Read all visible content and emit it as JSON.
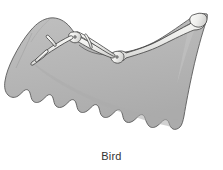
{
  "figure": {
    "caption": "Bird",
    "background_color": "#ffffff"
  },
  "illustration": {
    "membrane_label": "wing-membrane",
    "membrane_fill": "#b6b6b6",
    "membrane_shade_fill": "#a8a8a8",
    "membrane_highlight_fill": "#c4c4c4",
    "outline_color": "#4a4a4a",
    "bone_fill": "#f2f2f0",
    "bone_shade": "#d0d0ce",
    "bone_outline": "#3f3f3f",
    "feather_edge_color": "#6e6e6e"
  },
  "bones": [
    {
      "id": "humerus",
      "name": "humerus"
    },
    {
      "id": "radius",
      "name": "radius"
    },
    {
      "id": "ulna",
      "name": "ulna"
    },
    {
      "id": "carpometacarpus",
      "name": "carpometacarpus"
    },
    {
      "id": "digit-major",
      "name": "major-digit"
    },
    {
      "id": "digit-minor",
      "name": "minor-digit"
    },
    {
      "id": "alula",
      "name": "alula-digit"
    },
    {
      "id": "shoulder-joint",
      "name": "shoulder-joint"
    },
    {
      "id": "elbow-joint",
      "name": "elbow-joint"
    },
    {
      "id": "wrist-joint",
      "name": "wrist-joint"
    }
  ]
}
